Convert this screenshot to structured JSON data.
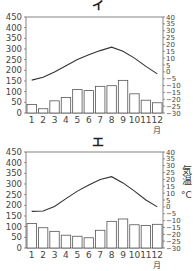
{
  "chart_data": [
    {
      "type": "bar+line",
      "title": "イ",
      "categories": [
        "1",
        "2",
        "3",
        "4",
        "5",
        "6",
        "7",
        "8",
        "9",
        "10",
        "11",
        "12"
      ],
      "xlabel": "月",
      "series": [
        {
          "name": "降水量 (mm)",
          "type": "bar",
          "axis": "left",
          "values": [
            40,
            20,
            57,
            73,
            110,
            105,
            125,
            128,
            153,
            90,
            60,
            48
          ]
        },
        {
          "name": "気温 (°C)",
          "type": "line",
          "axis": "right",
          "values": [
            -6,
            -4,
            0,
            4.5,
            9,
            12.5,
            15.5,
            18,
            15,
            10,
            4,
            -1.5
          ]
        }
      ],
      "left_axis": {
        "ylim": [
          0,
          450
        ],
        "ticks": [
          "0",
          "50",
          "100",
          "150",
          "200",
          "250",
          "300",
          "350",
          "400",
          "450"
        ]
      },
      "right_axis": {
        "ylim": [
          -30,
          40
        ],
        "ticks": [
          "-30",
          "-25",
          "-20",
          "-15",
          "-10",
          "-5",
          "0",
          "5",
          "10",
          "15",
          "20",
          "25",
          "30",
          "35",
          "40"
        ]
      },
      "grid": false
    },
    {
      "type": "bar+line",
      "title": "エ",
      "categories": [
        "1",
        "2",
        "3",
        "4",
        "5",
        "6",
        "7",
        "8",
        "9",
        "10",
        "11",
        "12"
      ],
      "xlabel": "月",
      "series": [
        {
          "name": "降水量 (mm)",
          "type": "bar",
          "axis": "left",
          "values": [
            115,
            95,
            78,
            60,
            55,
            48,
            83,
            125,
            136,
            109,
            106,
            111
          ]
        },
        {
          "name": "気温 (°C)",
          "type": "line",
          "axis": "right",
          "values": [
            -3.3,
            -3,
            0.3,
            6,
            11.5,
            16,
            20,
            22,
            17.5,
            11.5,
            5,
            0
          ]
        }
      ],
      "left_axis": {
        "ylim": [
          0,
          450
        ],
        "ticks": [
          "0",
          "50",
          "100",
          "150",
          "200",
          "250",
          "300",
          "350",
          "400",
          "450"
        ]
      },
      "right_axis": {
        "ylim": [
          -30,
          40
        ],
        "ticks": [
          "-30",
          "-25",
          "-20",
          "-15",
          "-10",
          "-5",
          "0",
          "5",
          "10",
          "15",
          "20",
          "25",
          "30",
          "35",
          "40"
        ],
        "label": "気温",
        "unit": "°C"
      },
      "grid": false
    }
  ]
}
